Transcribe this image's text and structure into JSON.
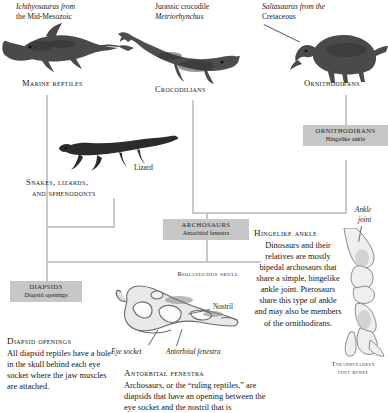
{
  "figure": {
    "type": "cladogram"
  },
  "captions": {
    "ichthyosaurus": {
      "line1": "Ichthyosaurus from",
      "line2": "the Mid-Mesozoic"
    },
    "metriorhynchus": {
      "line1": "Jurassic crocodile",
      "line2": "Metriorhynchus"
    },
    "saltasaurus": {
      "line1": "Saltasaurus from the",
      "line2": "Cretaceous"
    },
    "lizard": "Lizard"
  },
  "nodes": {
    "marine_reptiles": "Marine reptiles",
    "crocodilians": "Crocodilians",
    "ornithodirans": "Ornithodirans",
    "snakes_lizards": {
      "line1": "Snakes, lizards,",
      "line2": "and sphenodonts"
    }
  },
  "boxes": [
    {
      "id": "ornithodirans",
      "title": "ORNITHODIRANS",
      "trait": "Hingelike ankle"
    },
    {
      "id": "archosaurs",
      "title": "ARCHOSAURS",
      "trait": "Antorbital fenestra"
    },
    {
      "id": "diapsids",
      "title": "DIAPSIDS",
      "trait": "Diapsid openings"
    }
  ],
  "skull": {
    "title": "Riojasuchus skull",
    "labels": {
      "nostril": "Nostril",
      "eye_socket": "Eye socket",
      "antorbital_fenestra": "Antorbital fenestra"
    }
  },
  "ankle": {
    "title_line1": "Ankle",
    "title_line2": "joint",
    "foot_bones_line1": "Tyrannosaurus",
    "foot_bones_line2": "foot bones"
  },
  "text_blocks": {
    "diapsid_openings": {
      "heading": "Diapsid openings",
      "body": "All diapsid reptiles have a hole in the skull behind each eye socket where the jaw muscles are attached."
    },
    "hingelike_ankle": {
      "heading": "Hingelike ankle",
      "body": "Dinosaurs and their relatives are mostly bipedal archosaurs that share a simple, hingelike ankle joint. Pterosaurs share this type of ankle and may also be members of the ornithodirans."
    },
    "antorbital_fenestra": {
      "heading": "Antorbital fenestra",
      "body": "Archosaurs, or the “ruling reptiles,” are diapsids that have an opening between the eye socket and the nostril that is"
    }
  },
  "colors": {
    "connector": "#c9c9c9",
    "box_fill": "#c6c6c6",
    "text": "#1a1a1a",
    "background": "#ffffff"
  }
}
